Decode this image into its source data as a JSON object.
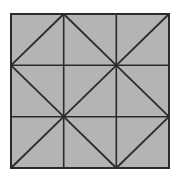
{
  "diagram": {
    "type": "3x3 grid with diagonals",
    "colors": {
      "fill": "#b4b4b4",
      "stroke": "#2b2b2b",
      "background": "#ffffff"
    },
    "square": {
      "x": 11,
      "y": 14,
      "w": 158,
      "h": 154
    },
    "grid_lines": {
      "vertical_x": [
        63.7,
        116.3
      ],
      "horizontal_y": [
        65.3,
        116.7
      ]
    },
    "diagonals": [
      {
        "x1": 11,
        "y1": 65.3,
        "x2": 63.7,
        "y2": 14
      },
      {
        "x1": 63.7,
        "y1": 14,
        "x2": 116.3,
        "y2": 65.3
      },
      {
        "x1": 116.3,
        "y1": 65.3,
        "x2": 169,
        "y2": 14
      },
      {
        "x1": 11,
        "y1": 65.3,
        "x2": 63.7,
        "y2": 116.7
      },
      {
        "x1": 63.7,
        "y1": 116.7,
        "x2": 116.3,
        "y2": 65.3
      },
      {
        "x1": 116.3,
        "y1": 65.3,
        "x2": 169,
        "y2": 116.7
      },
      {
        "x1": 11,
        "y1": 168,
        "x2": 63.7,
        "y2": 116.7
      },
      {
        "x1": 63.7,
        "y1": 116.7,
        "x2": 116.3,
        "y2": 168
      },
      {
        "x1": 116.3,
        "y1": 168,
        "x2": 169,
        "y2": 116.7
      }
    ]
  }
}
